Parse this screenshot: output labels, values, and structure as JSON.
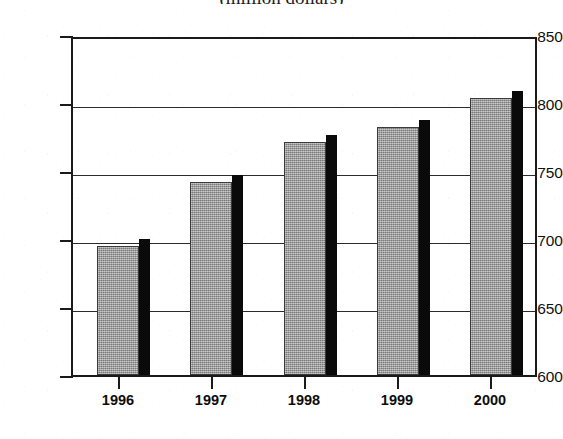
{
  "chart_data": {
    "type": "bar",
    "title": "(million dollars)",
    "title_clipped": true,
    "xlabel": "",
    "ylabel": "",
    "categories": [
      "1996",
      "1997",
      "1998",
      "1999",
      "2000"
    ],
    "values": [
      695,
      742,
      771,
      782,
      804
    ],
    "ylim": [
      600,
      850
    ],
    "yticks": [
      600,
      650,
      700,
      750,
      800,
      850
    ],
    "ytick_labels": [
      "600",
      "650",
      "700",
      "750",
      "800",
      "850"
    ],
    "grid": true,
    "grid_axis": "y",
    "legend": null,
    "series": [
      {
        "name": "value",
        "values": [
          695,
          742,
          771,
          782,
          804
        ]
      }
    ],
    "style": {
      "bar_face_color": "#9a9a9a",
      "bar_shadow_color": "#0a0a0a",
      "frame_color": "#1a1a1a",
      "grid_color": "#2b2b2b",
      "background": "#ffffff",
      "three_d_shadow": true
    }
  },
  "axes": {
    "y_labels": [
      "850",
      "800",
      "750",
      "700",
      "650",
      "600"
    ],
    "x_labels": [
      "1996",
      "1997",
      "1998",
      "1999",
      "2000"
    ]
  }
}
